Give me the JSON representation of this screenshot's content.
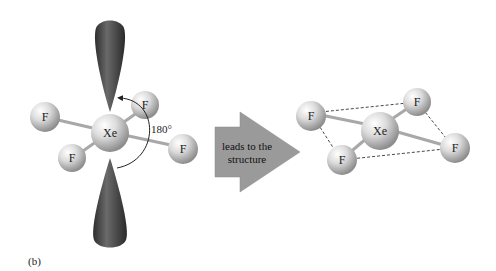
{
  "diagram": {
    "left_molecule": {
      "central_atom": "Xe",
      "ligands": [
        "F",
        "F",
        "F",
        "F"
      ],
      "lone_pairs": 2,
      "angle_label": "180°"
    },
    "arrow": {
      "line1": "leads to the",
      "line2": "structure"
    },
    "right_molecule": {
      "central_atom": "Xe",
      "ligands": [
        "F",
        "F",
        "F",
        "F"
      ],
      "geometry": "square planar"
    },
    "caption": "(b)",
    "colors": {
      "lobe": "#4a4a4a",
      "atom": "#d9d9d9",
      "arrow": "#9a9a9a",
      "bond": "#bdbdbd"
    }
  }
}
